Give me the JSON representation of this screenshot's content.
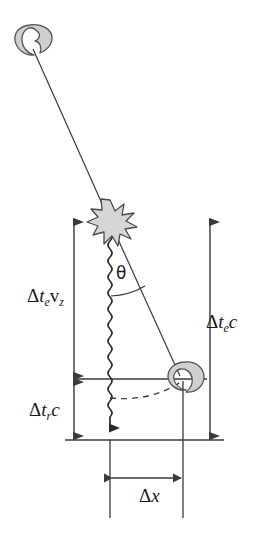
{
  "figure": {
    "domain": "diagram",
    "background_color": "#ffffff",
    "line_color": "#3a3a3a",
    "blob_fill": "#cfcfcf",
    "blob_stroke": "#555555",
    "star_fill": "#d6d6d6",
    "star_stroke": "#4a4a4a",
    "text_color": "#1a1a1a"
  },
  "labels": {
    "delta_te_vz": {
      "text": "Δt_e v_z",
      "delta": "Δ",
      "t": "t",
      "sub_e": "e",
      "v": "v",
      "sub_z": "z"
    },
    "delta_te_c": {
      "text": "Δt_e c",
      "delta": "Δ",
      "t": "t",
      "sub_e": "e",
      "c": "c"
    },
    "delta_tr_c": {
      "text": "Δt_r c",
      "delta": "Δ",
      "t": "t",
      "sub_r": "r",
      "c": "c"
    },
    "delta_x": {
      "text": "Δx",
      "delta": "Δ",
      "x": "x"
    },
    "theta": {
      "text": "θ"
    }
  },
  "elements": {
    "observer_top": "observer-blob-top",
    "observer_right": "observer-blob-right",
    "source": "star-burst",
    "photon_path": "wavy-photon-line",
    "sight_line": "line-of-sight",
    "dashed_arc": "dashed-arc",
    "left_measure": "delta-te-vz-measure-arrow",
    "right_measure": "delta-te-c-measure-arrow",
    "lower_left_measure": "delta-tr-c-measure-arrow",
    "bottom_measure": "delta-x-measure-arrow"
  },
  "geometry": {
    "star_position": [
      110,
      220
    ],
    "observer_top_position": [
      28,
      42
    ],
    "observer_right_position": [
      183,
      379
    ],
    "bottom_line_y": 440,
    "mid_line_y": 379,
    "left_axis_x": 74,
    "right_axis_x": 210,
    "dx_arrow_y": 478,
    "dx_from_x": 110,
    "dx_to_x": 183
  }
}
